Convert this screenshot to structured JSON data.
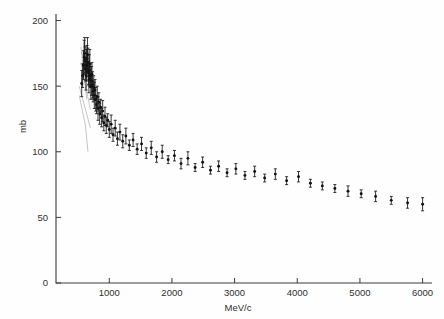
{
  "figure": {
    "name": "total-cross-section-vs-momentum",
    "background_color": "#fefefe",
    "ink_color": "#151515"
  },
  "chart_data": {
    "type": "scatter",
    "title": "",
    "subtitle": "",
    "xlabel": "MeV/c",
    "ylabel": "mb",
    "xlim": [
      150,
      6150
    ],
    "ylim": [
      0,
      205
    ],
    "grid": false,
    "legend": null,
    "x_ticks": [
      1000,
      2000,
      3000,
      4000,
      5000,
      6000
    ],
    "x_tick_labels": [
      "1000",
      "2000",
      "3000",
      "4000",
      "5000",
      "6000"
    ],
    "y_ticks": [
      0,
      50,
      100,
      150,
      200
    ],
    "y_tick_labels": [
      "0",
      "50",
      "100",
      "150",
      "200"
    ],
    "marker": "filled-circle",
    "error_bars": "vertical",
    "series": [
      {
        "name": "cross-section",
        "x": [
          560,
          575,
          588,
          600,
          608,
          615,
          622,
          630,
          638,
          645,
          652,
          660,
          668,
          675,
          682,
          690,
          698,
          706,
          715,
          724,
          733,
          742,
          752,
          762,
          773,
          784,
          796,
          808,
          820,
          833,
          847,
          862,
          878,
          895,
          913,
          932,
          952,
          975,
          1000,
          1030,
          1060,
          1095,
          1130,
          1170,
          1215,
          1265,
          1320,
          1380,
          1445,
          1515,
          1590,
          1670,
          1755,
          1845,
          1940,
          2040,
          2145,
          2255,
          2370,
          2490,
          2615,
          2745,
          2880,
          3020,
          3165,
          3320,
          3480,
          3650,
          3830,
          4020,
          4210,
          4400,
          4600,
          4810,
          5020,
          5250,
          5500,
          5760,
          6000
        ],
        "y": [
          152,
          158,
          166,
          172,
          175,
          170,
          163,
          158,
          166,
          171,
          174,
          168,
          160,
          155,
          162,
          167,
          158,
          150,
          154,
          159,
          151,
          146,
          149,
          143,
          147,
          140,
          136,
          142,
          133,
          138,
          129,
          134,
          126,
          131,
          122,
          127,
          120,
          124,
          117,
          121,
          113,
          118,
          110,
          115,
          108,
          112,
          105,
          109,
          102,
          106,
          99,
          103,
          96,
          100,
          94,
          97,
          91,
          95,
          88,
          92,
          86,
          89,
          84,
          87,
          82,
          85,
          80,
          83,
          78,
          81,
          76,
          74,
          72,
          70,
          68,
          66,
          63,
          61,
          60
        ],
        "yerr": [
          10,
          9,
          11,
          13,
          12,
          10,
          9,
          11,
          12,
          10,
          13,
          11,
          9,
          10,
          12,
          11,
          9,
          10,
          11,
          9,
          10,
          8,
          9,
          10,
          8,
          9,
          7,
          8,
          9,
          7,
          8,
          6,
          7,
          8,
          6,
          7,
          6,
          5,
          6,
          7,
          5,
          6,
          5,
          6,
          5,
          6,
          4,
          5,
          4,
          5,
          4,
          5,
          4,
          5,
          3,
          4,
          4,
          5,
          3,
          4,
          3,
          4,
          3,
          4,
          3,
          4,
          3,
          4,
          3,
          4,
          3,
          3,
          3,
          4,
          3,
          4,
          3,
          4,
          5
        ]
      }
    ],
    "annotations": [
      {
        "name": "guide-line-upper",
        "description": "faint hand-drawn line through low-momentum cluster"
      },
      {
        "name": "guide-line-lower",
        "description": "faint hand-drawn line below low-momentum cluster"
      }
    ]
  }
}
